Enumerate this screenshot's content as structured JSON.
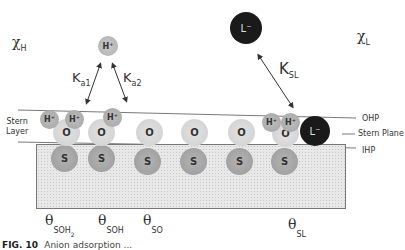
{
  "labels": {
    "chi_h": {
      "symbol": "χ",
      "sub": "H"
    },
    "chi_l": {
      "symbol": "χ",
      "sub": "L"
    },
    "ka1": {
      "symbol": "K",
      "sub": "a1"
    },
    "ka2": {
      "symbol": "K",
      "sub": "a2"
    },
    "ksl": {
      "symbol": "K",
      "sub": "SL"
    },
    "stern_layer_line1": "Stern",
    "stern_layer_line2": "Layer",
    "ohp": "OHP",
    "stern_plane": "Stern Plane",
    "ihp": "IHP"
  },
  "free_ions": {
    "proton": "H⁺",
    "ligand": "L⁻"
  },
  "surface_sites": [
    {
      "s": "S",
      "o": "O",
      "h": [
        "H⁺",
        "H⁺"
      ]
    },
    {
      "s": "S",
      "o": "O",
      "h": [
        "H⁺"
      ]
    },
    {
      "s": "S",
      "o": "O",
      "h": []
    },
    {
      "s": "S",
      "o": "O",
      "h": []
    },
    {
      "s": "S",
      "o": "O",
      "h": []
    },
    {
      "s": "S",
      "o": "O",
      "h": [
        "H⁺",
        "H⁺"
      ],
      "ligand": "L⁻"
    }
  ],
  "coverage": {
    "soh2": {
      "symbol": "θ",
      "sub": "SOH",
      "sub2": "2"
    },
    "soh": {
      "symbol": "θ",
      "sub": "SOH"
    },
    "so": {
      "symbol": "θ",
      "sub": "SO"
    },
    "sl": {
      "symbol": "θ",
      "sub": "SL"
    }
  },
  "caption": {
    "fig": "FIG. 10",
    "text": "Anion adsorption ..."
  },
  "colors": {
    "substrate_fill": "#e6e6e6",
    "s_atom": "#a8a8a8",
    "o_atom": "#d9d9d9",
    "h_atom": "#b0b0b0",
    "ligand": "#1a1a1a"
  }
}
